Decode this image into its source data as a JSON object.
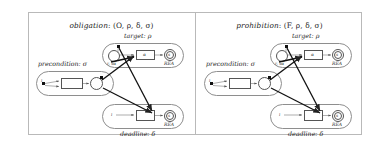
{
  "figure": {
    "panels": [
      {
        "id": "obligation",
        "title_italic": "obligation",
        "title_rest": ": (O, ρ, δ, σ)",
        "clusters": {
          "precondition": "precondition: σ",
          "target": "target: ρ",
          "deadline": "deadline: δ"
        },
        "nodes": {
          "target_box": "α",
          "deadline_box": "",
          "precondition_box": "",
          "target_end": "s",
          "deadline_end": "s",
          "junction": "δ"
        },
        "annotations": {
          "target_rea": "REA",
          "deadline_rea": "REA",
          "target_inner": "r, sα",
          "precondition_inner": "i",
          "deadline_inner": "i"
        }
      },
      {
        "id": "prohibition",
        "title_italic": "prohibition",
        "title_rest": ": (F, ρ, δ, σ)",
        "clusters": {
          "precondition": "precondition: σ",
          "target": "target: ρ",
          "deadline": "deadline: δ"
        },
        "nodes": {
          "target_box": "α",
          "deadline_box": "",
          "precondition_box": "",
          "target_end": "s",
          "deadline_end": "s",
          "junction": "δ"
        },
        "annotations": {
          "target_rea": "REA",
          "deadline_rea": "REA",
          "target_inner": "r, sα",
          "precondition_inner": "i",
          "deadline_inner": "i"
        }
      }
    ],
    "colors": {
      "frame": "#b9b9b9",
      "stroke": "#555555",
      "marker": "#111111",
      "background": "#ffffff"
    }
  }
}
